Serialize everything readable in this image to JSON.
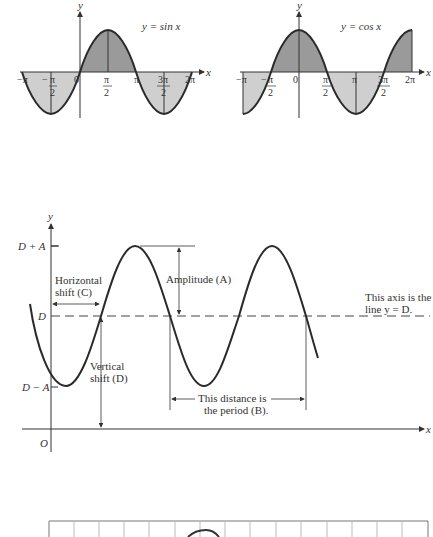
{
  "figure_top_left": {
    "title": "y = sin x",
    "y_axis_label": "y",
    "x_axis_label": "x",
    "ticks": [
      {
        "num": "−π",
        "den": ""
      },
      {
        "num": "π",
        "den": "2",
        "sign": "−"
      },
      {
        "num": "0",
        "den": ""
      },
      {
        "num": "π",
        "den": "2"
      },
      {
        "num": "π",
        "den": ""
      },
      {
        "num": "3π",
        "den": "2"
      },
      {
        "num": "2π",
        "den": ""
      }
    ]
  },
  "figure_top_right": {
    "title": "y = cos x",
    "y_axis_label": "y",
    "x_axis_label": "x",
    "ticks": [
      {
        "num": "−π",
        "den": ""
      },
      {
        "num": "π",
        "den": "2",
        "sign": "−"
      },
      {
        "num": "0",
        "den": ""
      },
      {
        "num": "π",
        "den": "2"
      },
      {
        "num": "π",
        "den": ""
      },
      {
        "num": "3π",
        "den": "2"
      },
      {
        "num": "2π",
        "den": ""
      }
    ]
  },
  "figure_middle": {
    "y_axis_label": "y",
    "x_axis_label": "x",
    "origin_label": "O",
    "y_ticks": [
      "D + A",
      "D",
      "D − A"
    ],
    "annotations": {
      "horizontal_shift_1": "Horizontal",
      "horizontal_shift_2": "shift (C)",
      "amplitude": "Amplitude (A)",
      "axis_note_1": "This axis is the",
      "axis_note_2": "line  y = D.",
      "vertical_shift_1": "Vertical",
      "vertical_shift_2": "shift (D)",
      "period_1": "This distance is",
      "period_2": "the period (B)."
    }
  },
  "figure_bottom": {
    "grid_columns": 15
  },
  "colors": {
    "curve": "#2a2a2a",
    "axis": "#333333",
    "shade_positive": "#9a9a9a",
    "shade_negative": "#cfcfcf",
    "dashed": "#444444"
  }
}
